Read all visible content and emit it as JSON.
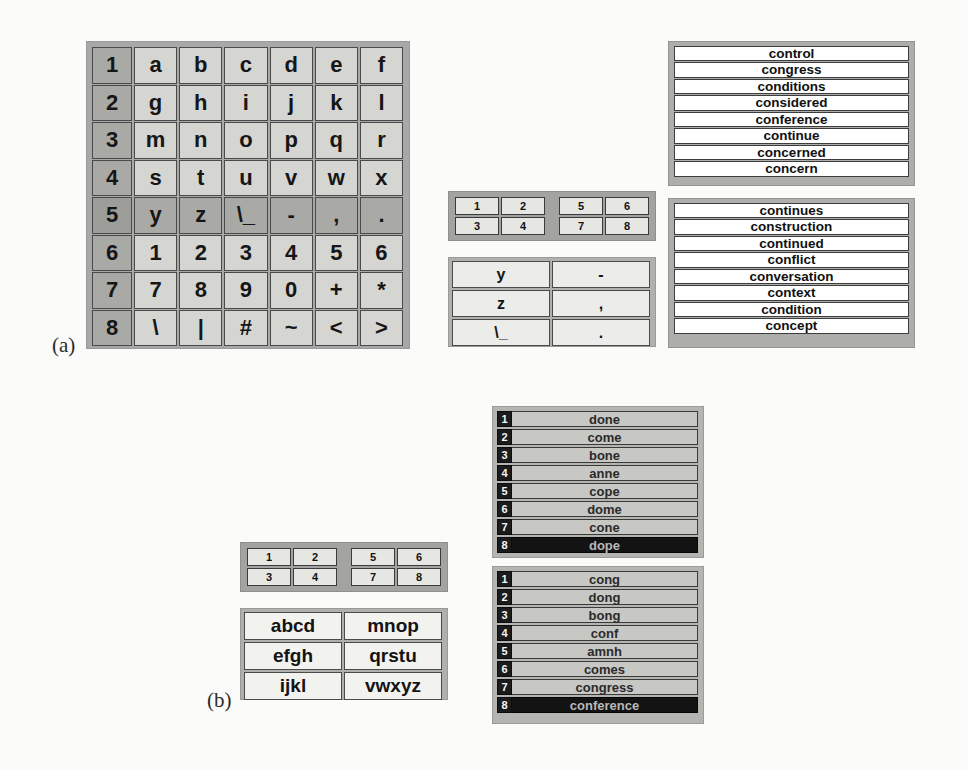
{
  "figure": {
    "panel_a_label": "(a)",
    "panel_b_label": "(b)"
  },
  "colors": {
    "panel_background": "#a8a8a8",
    "key_face": "#d5d5d2",
    "key_border": "#4a4a4a",
    "row_highlight": "#a9a9a6",
    "selection_dark": "#131313",
    "selection_text": "#b9b9b9",
    "word_row_white": "#ffffff",
    "word_row_gray": "#c7c7c4",
    "number_badge": "#1b1b1b",
    "page_background": "#fbfbfa"
  },
  "panel_a": {
    "char_grid": {
      "name": "character-grid",
      "active_row_index": 4,
      "rows": [
        {
          "number": "1",
          "keys": [
            "a",
            "b",
            "c",
            "d",
            "e",
            "f"
          ]
        },
        {
          "number": "2",
          "keys": [
            "g",
            "h",
            "i",
            "j",
            "k",
            "l"
          ]
        },
        {
          "number": "3",
          "keys": [
            "m",
            "n",
            "o",
            "p",
            "q",
            "r"
          ]
        },
        {
          "number": "4",
          "keys": [
            "s",
            "t",
            "u",
            "v",
            "w",
            "x"
          ]
        },
        {
          "number": "5",
          "keys": [
            "y",
            "z",
            "\\_",
            "-",
            ",",
            "."
          ]
        },
        {
          "number": "6",
          "keys": [
            "1",
            "2",
            "3",
            "4",
            "5",
            "6"
          ]
        },
        {
          "number": "7",
          "keys": [
            "7",
            "8",
            "9",
            "0",
            "+",
            "*"
          ]
        },
        {
          "number": "8",
          "keys": [
            "\\",
            "|",
            "#",
            "~",
            "<",
            ">"
          ]
        }
      ]
    },
    "keypad": {
      "name": "group-keypad",
      "left_group": [
        "1",
        "2",
        "3",
        "4"
      ],
      "right_group": [
        "5",
        "6",
        "7",
        "8"
      ],
      "selected": null
    },
    "chooser": {
      "name": "character-chooser",
      "rows": [
        [
          "y",
          "-"
        ],
        [
          "z",
          ","
        ],
        [
          "\\_",
          "."
        ]
      ]
    },
    "word_list_top": {
      "name": "prediction-list-primary",
      "words": [
        "control",
        "congress",
        "conditions",
        "considered",
        "conference",
        "continue",
        "concerned",
        "concern"
      ]
    },
    "word_list_bottom": {
      "name": "prediction-list-secondary",
      "words": [
        "continues",
        "construction",
        "continued",
        "conflict",
        "conversation",
        "context",
        "condition",
        "concept"
      ]
    }
  },
  "panel_b": {
    "keypad": {
      "name": "group-keypad",
      "left_group": [
        "1",
        "2",
        "3",
        "4"
      ],
      "right_group": [
        "5",
        "6",
        "7",
        "8"
      ],
      "selected": "8"
    },
    "chooser": {
      "name": "letter-group-chooser",
      "rows": [
        [
          "abcd",
          "mnop"
        ],
        [
          "efgh",
          "qrstu"
        ],
        [
          "ijkl",
          "vwxyz"
        ]
      ]
    },
    "word_list_top": {
      "name": "prediction-list-primary",
      "selected_index": 7,
      "items": [
        {
          "number": "1",
          "word": "done"
        },
        {
          "number": "2",
          "word": "come"
        },
        {
          "number": "3",
          "word": "bone"
        },
        {
          "number": "4",
          "word": "anne"
        },
        {
          "number": "5",
          "word": "cope"
        },
        {
          "number": "6",
          "word": "dome"
        },
        {
          "number": "7",
          "word": "cone"
        },
        {
          "number": "8",
          "word": "dope"
        }
      ]
    },
    "word_list_bottom": {
      "name": "prediction-list-secondary",
      "selected_index": 7,
      "items": [
        {
          "number": "1",
          "word": "cong"
        },
        {
          "number": "2",
          "word": "dong"
        },
        {
          "number": "3",
          "word": "bong"
        },
        {
          "number": "4",
          "word": "conf"
        },
        {
          "number": "5",
          "word": "amnh"
        },
        {
          "number": "6",
          "word": "comes"
        },
        {
          "number": "7",
          "word": "congress"
        },
        {
          "number": "8",
          "word": "conference"
        }
      ]
    }
  }
}
